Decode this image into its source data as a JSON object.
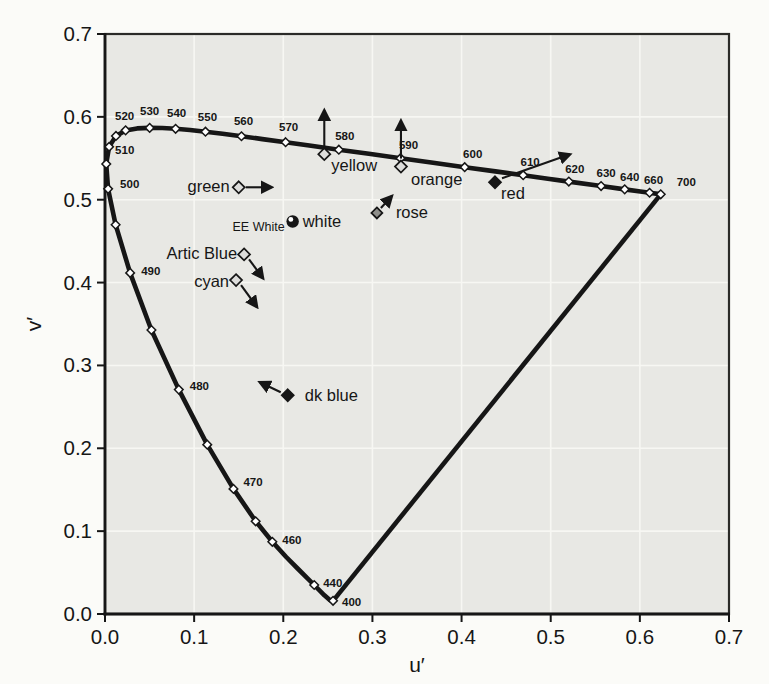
{
  "figure": {
    "page_bg": "#fbfbf8",
    "plot_bg": "#e8e8e4",
    "grid_color": "#f7f7f3",
    "ink_color": "#161616",
    "marker_open_fill": "#dddddb",
    "rose_fill": "#8f8f8b"
  },
  "chart_data": {
    "type": "scatter",
    "subtype": "CIE 1976 u'v' chromaticity diagram",
    "title": "",
    "xlabel": "u′",
    "ylabel": "v′",
    "xlim": [
      0,
      0.7
    ],
    "ylim": [
      0,
      0.7
    ],
    "xticks": [
      "0.0",
      "0.1",
      "0.2",
      "0.3",
      "0.4",
      "0.5",
      "0.6",
      "0.7"
    ],
    "yticks": [
      "0.0",
      "0.1",
      "0.2",
      "0.3",
      "0.4",
      "0.5",
      "0.6",
      "0.7"
    ],
    "grid": true,
    "legend": false,
    "spectral_locus": [
      {
        "nm": 400,
        "u": 0.2558,
        "v": 0.0159,
        "marker": true,
        "label": "400",
        "dx": 9,
        "dy": 5,
        "anchor": "start"
      },
      {
        "nm": 410,
        "u": 0.2545,
        "v": 0.0159
      },
      {
        "nm": 420,
        "u": 0.2522,
        "v": 0.0169
      },
      {
        "nm": 430,
        "u": 0.2461,
        "v": 0.0226
      },
      {
        "nm": 440,
        "u": 0.2347,
        "v": 0.035,
        "marker": true,
        "label": "440",
        "dx": 9,
        "dy": 2,
        "anchor": "start"
      },
      {
        "nm": 445,
        "u": 0.2266,
        "v": 0.0437
      },
      {
        "nm": 450,
        "u": 0.2161,
        "v": 0.0549
      },
      {
        "nm": 455,
        "u": 0.2033,
        "v": 0.0688
      },
      {
        "nm": 460,
        "u": 0.1877,
        "v": 0.0871,
        "marker": true,
        "label": "460",
        "dx": 10,
        "dy": 2,
        "anchor": "start"
      },
      {
        "nm": 465,
        "u": 0.169,
        "v": 0.1119,
        "marker": true
      },
      {
        "nm": 470,
        "u": 0.1441,
        "v": 0.151,
        "marker": true,
        "label": "470",
        "dx": 10,
        "dy": -3,
        "anchor": "start"
      },
      {
        "nm": 475,
        "u": 0.1147,
        "v": 0.2044,
        "marker": true
      },
      {
        "nm": 480,
        "u": 0.0828,
        "v": 0.2708,
        "marker": true,
        "label": "480",
        "dx": 11,
        "dy": 0,
        "anchor": "start"
      },
      {
        "nm": 485,
        "u": 0.0521,
        "v": 0.3427,
        "marker": true
      },
      {
        "nm": 490,
        "u": 0.0282,
        "v": 0.4117,
        "marker": true,
        "label": "490",
        "dx": 11,
        "dy": 2,
        "anchor": "start"
      },
      {
        "nm": 495,
        "u": 0.0119,
        "v": 0.4698,
        "marker": true
      },
      {
        "nm": 500,
        "u": 0.0035,
        "v": 0.5131,
        "marker": true,
        "label": "500",
        "dx": 12,
        "dy": -1,
        "anchor": "start"
      },
      {
        "nm": 505,
        "u": 0.0014,
        "v": 0.5432,
        "marker": true
      },
      {
        "nm": 510,
        "u": 0.0046,
        "v": 0.5638,
        "marker": true,
        "label": "510",
        "dx": 6,
        "dy": 7,
        "anchor": "start"
      },
      {
        "nm": 515,
        "u": 0.0123,
        "v": 0.577,
        "marker": true
      },
      {
        "nm": 520,
        "u": 0.0231,
        "v": 0.5837,
        "marker": true,
        "label": "520",
        "dx": -1,
        "dy": -10,
        "anchor": "middle"
      },
      {
        "nm": 525,
        "u": 0.036,
        "v": 0.5861
      },
      {
        "nm": 530,
        "u": 0.0501,
        "v": 0.5867,
        "marker": true,
        "label": "530",
        "dx": 0,
        "dy": -13,
        "anchor": "middle"
      },
      {
        "nm": 535,
        "u": 0.0643,
        "v": 0.5866
      },
      {
        "nm": 540,
        "u": 0.0792,
        "v": 0.5856,
        "marker": true,
        "label": "540",
        "dx": 1,
        "dy": -12,
        "anchor": "middle"
      },
      {
        "nm": 545,
        "u": 0.0953,
        "v": 0.5841
      },
      {
        "nm": 550,
        "u": 0.1127,
        "v": 0.5821,
        "marker": true,
        "label": "550",
        "dx": 2,
        "dy": -11,
        "anchor": "middle"
      },
      {
        "nm": 555,
        "u": 0.1319,
        "v": 0.5795
      },
      {
        "nm": 560,
        "u": 0.1531,
        "v": 0.5766,
        "marker": true,
        "label": "560",
        "dx": 2,
        "dy": -11,
        "anchor": "middle"
      },
      {
        "nm": 565,
        "u": 0.1766,
        "v": 0.5732
      },
      {
        "nm": 570,
        "u": 0.2026,
        "v": 0.5694,
        "marker": true,
        "label": "570",
        "dx": 3,
        "dy": -11,
        "anchor": "middle"
      },
      {
        "nm": 575,
        "u": 0.2312,
        "v": 0.5651
      },
      {
        "nm": 580,
        "u": 0.2623,
        "v": 0.5604,
        "marker": true,
        "label": "580",
        "dx": 6,
        "dy": -10,
        "anchor": "middle"
      },
      {
        "nm": 585,
        "u": 0.296,
        "v": 0.5554
      },
      {
        "nm": 590,
        "u": 0.3315,
        "v": 0.5501,
        "marker": true,
        "label": "590",
        "dx": 8,
        "dy": -9,
        "anchor": "middle"
      },
      {
        "nm": 595,
        "u": 0.3681,
        "v": 0.5446
      },
      {
        "nm": 600,
        "u": 0.4035,
        "v": 0.5393,
        "marker": true,
        "label": "600",
        "dx": 8,
        "dy": -9,
        "anchor": "middle"
      },
      {
        "nm": 605,
        "u": 0.4379,
        "v": 0.5342
      },
      {
        "nm": 610,
        "u": 0.4691,
        "v": 0.5296,
        "marker": true,
        "label": "610",
        "dx": 7,
        "dy": -9,
        "anchor": "middle"
      },
      {
        "nm": 615,
        "u": 0.4968,
        "v": 0.5254
      },
      {
        "nm": 620,
        "u": 0.5203,
        "v": 0.5219,
        "marker": true,
        "label": "620",
        "dx": 6,
        "dy": -9,
        "anchor": "middle"
      },
      {
        "nm": 630,
        "u": 0.5565,
        "v": 0.5165,
        "marker": true,
        "label": "630",
        "dx": 5,
        "dy": -9,
        "anchor": "middle"
      },
      {
        "nm": 640,
        "u": 0.583,
        "v": 0.5125,
        "marker": true,
        "label": "640",
        "dx": 5,
        "dy": -8,
        "anchor": "middle"
      },
      {
        "nm": 650,
        "u": 0.6005,
        "v": 0.5099
      },
      {
        "nm": 660,
        "u": 0.6109,
        "v": 0.5084,
        "marker": true,
        "label": "660",
        "dx": 4,
        "dy": -9,
        "anchor": "middle"
      },
      {
        "nm": 680,
        "u": 0.6199,
        "v": 0.507
      },
      {
        "nm": 700,
        "u": 0.6234,
        "v": 0.5065,
        "marker": true,
        "label": "700",
        "dx": 16,
        "dy": -8,
        "anchor": "start"
      }
    ],
    "purple_boundary": {
      "from_nm": 400,
      "to_nm": 700
    },
    "color_points": [
      {
        "name": "green",
        "label": "green",
        "u": 0.15,
        "v": 0.515,
        "marker": "diamond-open",
        "anchor": "end",
        "ldx": -9,
        "ldy": 5,
        "arrow": [
          7,
          0,
          33,
          0
        ]
      },
      {
        "name": "yellow",
        "label": "yellow",
        "u": 0.246,
        "v": 0.555,
        "marker": "diamond-open",
        "anchor": "start",
        "ldx": 7,
        "ldy": 17,
        "arrow": [
          0,
          -8,
          0,
          -44
        ]
      },
      {
        "name": "orange",
        "label": "orange",
        "u": 0.332,
        "v": 0.54,
        "marker": "diamond-open",
        "anchor": "start",
        "ldx": 10,
        "ldy": 18,
        "arrow": [
          0,
          -8,
          0,
          -46
        ]
      },
      {
        "name": "red",
        "label": "red",
        "u": 0.4375,
        "v": 0.521,
        "marker": "diamond-filled",
        "anchor": "start",
        "ldx": 6,
        "ldy": 17,
        "arrow": [
          7,
          -4,
          75,
          -28
        ]
      },
      {
        "name": "white",
        "label": "white",
        "sub_label": "EE White",
        "u": 0.2105,
        "v": 0.4737,
        "marker": "circle-dot",
        "anchor": "start",
        "ldx": 10,
        "ldy": 5,
        "sub_anchor": "end",
        "sub_ldx": -8,
        "sub_ldy": 9
      },
      {
        "name": "rose",
        "label": "rose",
        "u": 0.305,
        "v": 0.484,
        "marker": "diamond-rose",
        "anchor": "start",
        "ldx": 19,
        "ldy": 5,
        "arrow": [
          4,
          -5,
          15,
          -17
        ]
      },
      {
        "name": "artic-blue",
        "label": "Artic Blue",
        "u": 0.156,
        "v": 0.434,
        "marker": "diamond-open",
        "anchor": "end",
        "ldx": -7,
        "ldy": 5,
        "arrow": [
          5,
          5,
          19,
          24
        ]
      },
      {
        "name": "cyan",
        "label": "cyan",
        "u": 0.147,
        "v": 0.403,
        "marker": "diamond-open",
        "anchor": "end",
        "ldx": -7,
        "ldy": 7,
        "arrow": [
          5,
          5,
          21,
          27
        ]
      },
      {
        "name": "dk-blue",
        "label": "dk blue",
        "u": 0.205,
        "v": 0.264,
        "marker": "diamond-filled",
        "anchor": "start",
        "ldx": 17,
        "ldy": 6,
        "arrow": [
          -7,
          -3,
          -28,
          -13
        ]
      }
    ]
  }
}
